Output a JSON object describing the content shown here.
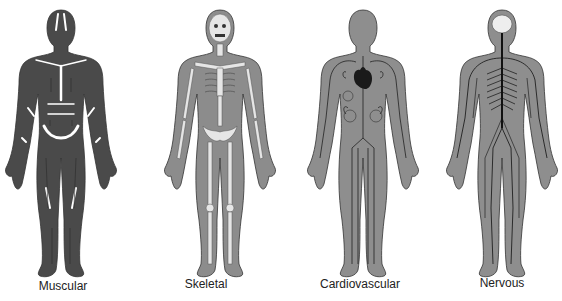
{
  "diagram": {
    "title": "",
    "systems": [
      {
        "id": "muscular",
        "label": "Muscular",
        "body_color": "#4a4a4a",
        "detail_color": "#ffffff"
      },
      {
        "id": "skeletal",
        "label": "Skeletal",
        "body_color": "#8c8c8c",
        "detail_color": "#e6e6e6"
      },
      {
        "id": "cardiovascular",
        "label": "Cardiovascular",
        "body_color": "#8e8e8e",
        "detail_color": "#1a1a1a"
      },
      {
        "id": "nervous",
        "label": "Nervous",
        "body_color": "#8e8e8e",
        "detail_color": "#111111"
      }
    ]
  }
}
